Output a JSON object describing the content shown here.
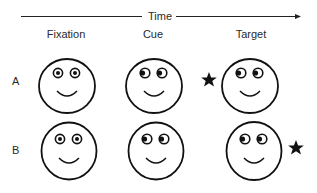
{
  "axis": {
    "label": "Time",
    "direction": "right"
  },
  "columns": [
    {
      "label": "Fixation"
    },
    {
      "label": "Cue"
    },
    {
      "label": "Target"
    }
  ],
  "rows": [
    {
      "label": "A",
      "trial_type": "valid",
      "faces": [
        {
          "stage": "Fixation",
          "gaze": "center"
        },
        {
          "stage": "Cue",
          "gaze": "left"
        },
        {
          "stage": "Target",
          "gaze": "left"
        }
      ],
      "target_side": "left",
      "target_icon": "star-icon"
    },
    {
      "label": "B",
      "trial_type": "invalid",
      "faces": [
        {
          "stage": "Fixation",
          "gaze": "center"
        },
        {
          "stage": "Cue",
          "gaze": "left"
        },
        {
          "stage": "Target",
          "gaze": "left"
        }
      ],
      "target_side": "right",
      "target_icon": "star-icon"
    }
  ],
  "colors": {
    "stroke": "#111111",
    "background": "#ffffff"
  }
}
